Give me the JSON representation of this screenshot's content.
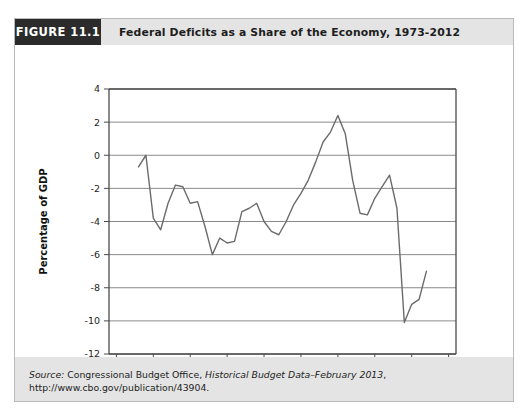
{
  "figure": {
    "tag": "FIGURE 11.1",
    "title": "Federal Deficits as a Share of the Economy, 1973-2012"
  },
  "source": {
    "label": "Source:",
    "org": " Congressional Budget Office, ",
    "publication": "Historical Budget Data–February 2013",
    "rest": ", http://www.cbo.gov/publication/43904."
  },
  "colors": {
    "tag_background": "#2b2b2b",
    "band_background": "#e4e4e4",
    "line": "#6b6b6b",
    "gridline": "#8a8a8a",
    "axis": "#4a4a4a",
    "plot_background": "#ffffff"
  },
  "chart_data": {
    "type": "line",
    "title": "Federal Deficits as a Share of the Economy, 1973-2012",
    "xlabel": "",
    "ylabel": "Percentage of GDP",
    "xlim": [
      1969,
      2016
    ],
    "ylim": [
      -12,
      4
    ],
    "xticks": [
      1970,
      1975,
      1980,
      1985,
      1990,
      1995,
      2000,
      2005,
      2010,
      2015
    ],
    "yticks": [
      4,
      2,
      0,
      -2,
      -4,
      -6,
      -8,
      -10,
      -12
    ],
    "xtick_labels": [
      "1970",
      "1975",
      "1980",
      "1985",
      "1990",
      "1995",
      "2000",
      "2005",
      "2010",
      "2015"
    ],
    "ytick_labels": [
      "4",
      "2",
      "0",
      "-2",
      "-4",
      "-6",
      "-8",
      "-10",
      "-12"
    ],
    "grid": "horizontal",
    "legend": "none",
    "series": [
      {
        "name": "Federal deficit (surplus) as percentage of GDP",
        "x": [
          1973,
          1974,
          1975,
          1976,
          1977,
          1978,
          1979,
          1980,
          1981,
          1982,
          1983,
          1984,
          1985,
          1986,
          1987,
          1988,
          1989,
          1990,
          1991,
          1992,
          1993,
          1994,
          1995,
          1996,
          1997,
          1998,
          1999,
          2000,
          2001,
          2002,
          2003,
          2004,
          2005,
          2006,
          2007,
          2008,
          2009,
          2010,
          2011,
          2012
        ],
        "values": [
          -0.7,
          0.0,
          -3.8,
          -4.5,
          -2.9,
          -1.8,
          -1.9,
          -2.9,
          -2.8,
          -4.3,
          -6.0,
          -5.0,
          -5.3,
          -5.2,
          -3.4,
          -3.2,
          -2.9,
          -4.0,
          -4.6,
          -4.8,
          -4.0,
          -3.0,
          -2.3,
          -1.5,
          -0.4,
          0.8,
          1.4,
          2.4,
          1.3,
          -1.5,
          -3.5,
          -3.6,
          -2.6,
          -1.9,
          -1.2,
          -3.2,
          -10.1,
          -9.0,
          -8.7,
          -7.0
        ]
      }
    ]
  }
}
